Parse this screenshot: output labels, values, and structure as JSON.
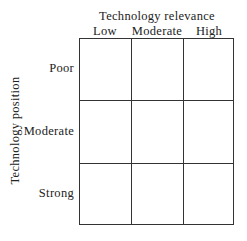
{
  "matrix": {
    "x_axis_title": "Technology relevance",
    "y_axis_title": "Technology position",
    "columns": [
      "Low",
      "Moderate",
      "High"
    ],
    "rows": [
      "Poor",
      "Moderate",
      "Strong"
    ],
    "cells": [
      [
        "",
        "",
        ""
      ],
      [
        "",
        "",
        ""
      ],
      [
        "",
        "",
        ""
      ]
    ]
  }
}
